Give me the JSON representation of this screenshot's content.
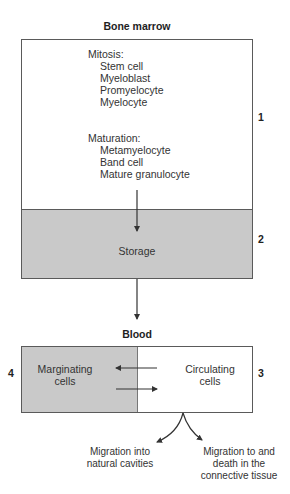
{
  "bone_marrow": {
    "title": "Bone marrow",
    "mitosis": {
      "header": "Mitosis:",
      "items": [
        "Stem cell",
        "Myeloblast",
        "Promyelocyte",
        "Myelocyte"
      ]
    },
    "maturation": {
      "header": "Maturation:",
      "items": [
        "Metamyelocyte",
        "Band cell",
        "Mature granulocyte"
      ]
    },
    "compartment_number": "1",
    "storage": {
      "label": "Storage",
      "compartment_number": "2"
    }
  },
  "blood": {
    "title": "Blood",
    "marginating": {
      "line1": "Marginating",
      "line2": "cells",
      "compartment_number": "4"
    },
    "circulating": {
      "line1": "Circulating",
      "line2": "cells",
      "compartment_number": "3"
    }
  },
  "outcomes": {
    "left": {
      "line1": "Migration into",
      "line2": "natural cavities"
    },
    "right": {
      "line1": "Migration to and",
      "line2": "death in the",
      "line3": "connective tissue"
    }
  },
  "colors": {
    "storage_fill": "#c9c9c9",
    "marginating_fill": "#c9c9c9",
    "line": "#333333"
  }
}
